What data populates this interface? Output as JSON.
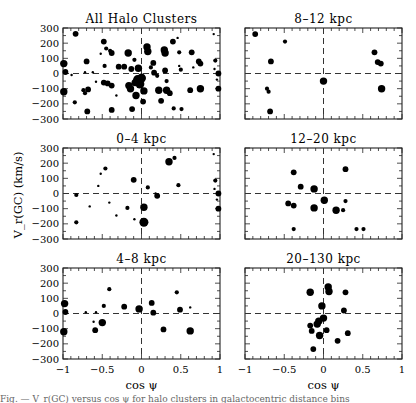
{
  "figure": {
    "ylabel": "V_r(GC) (km/s)",
    "xlabel": "cos ψ",
    "caption": "Fig. — V_r(GC) versus cos ψ for halo clusters in galactocentric distance bins"
  },
  "chart_data": [
    {
      "type": "scatter",
      "title": "All Halo Clusters",
      "xlabel": "",
      "ylabel": "V_r(GC) (km/s)",
      "xlim": [
        -1,
        1
      ],
      "ylim": [
        -300,
        300
      ],
      "xticks": [
        -1,
        -0.5,
        0,
        0.5,
        1
      ],
      "yticks": [
        -300,
        -200,
        -100,
        0,
        100,
        200,
        300
      ],
      "grid": false,
      "reference_lines": {
        "x": 0,
        "y": 0,
        "style": "dashed"
      },
      "points": [
        {
          "x": -0.84,
          "y": 262,
          "s": 3
        },
        {
          "x": -0.99,
          "y": 65,
          "s": 4
        },
        {
          "x": -0.97,
          "y": 10,
          "s": 3
        },
        {
          "x": -0.99,
          "y": -120,
          "s": 4
        },
        {
          "x": -0.89,
          "y": -10,
          "s": 1
        },
        {
          "x": -0.85,
          "y": -190,
          "s": 2
        },
        {
          "x": -0.7,
          "y": 80,
          "s": 3
        },
        {
          "x": -0.72,
          "y": 8,
          "s": 1
        },
        {
          "x": -0.74,
          "y": -110,
          "s": 2
        },
        {
          "x": -0.72,
          "y": -130,
          "s": 2
        },
        {
          "x": -0.68,
          "y": -105,
          "s": 3
        },
        {
          "x": -0.69,
          "y": -250,
          "s": 3
        },
        {
          "x": -0.62,
          "y": 8,
          "s": 1
        },
        {
          "x": -0.58,
          "y": -55,
          "s": 1
        },
        {
          "x": -0.48,
          "y": 210,
          "s": 3
        },
        {
          "x": -0.52,
          "y": 130,
          "s": 1
        },
        {
          "x": -0.45,
          "y": 165,
          "s": 2
        },
        {
          "x": -0.4,
          "y": 150,
          "s": 2
        },
        {
          "x": -0.38,
          "y": 135,
          "s": 3
        },
        {
          "x": -0.47,
          "y": 50,
          "s": 2
        },
        {
          "x": -0.48,
          "y": -60,
          "s": 3
        },
        {
          "x": -0.43,
          "y": -65,
          "s": 3
        },
        {
          "x": -0.38,
          "y": -80,
          "s": 3
        },
        {
          "x": -0.38,
          "y": -240,
          "s": 3
        },
        {
          "x": -0.32,
          "y": -145,
          "s": 1
        },
        {
          "x": -0.29,
          "y": 45,
          "s": 3
        },
        {
          "x": -0.22,
          "y": 45,
          "s": 3
        },
        {
          "x": -0.17,
          "y": 135,
          "s": 4
        },
        {
          "x": -0.16,
          "y": -80,
          "s": 4
        },
        {
          "x": -0.14,
          "y": -100,
          "s": 4
        },
        {
          "x": -0.13,
          "y": 30,
          "s": 3
        },
        {
          "x": -0.12,
          "y": -235,
          "s": 3
        },
        {
          "x": -0.09,
          "y": 90,
          "s": 2
        },
        {
          "x": -0.08,
          "y": -60,
          "s": 4
        },
        {
          "x": -0.07,
          "y": -145,
          "s": 4
        },
        {
          "x": -0.05,
          "y": -40,
          "s": 5
        },
        {
          "x": -0.04,
          "y": 35,
          "s": 4
        },
        {
          "x": -0.02,
          "y": -70,
          "s": 5
        },
        {
          "x": 0.0,
          "y": -30,
          "s": 5
        },
        {
          "x": 0.03,
          "y": -115,
          "s": 4
        },
        {
          "x": 0.02,
          "y": -185,
          "s": 3
        },
        {
          "x": 0.07,
          "y": 175,
          "s": 4
        },
        {
          "x": 0.08,
          "y": 145,
          "s": 4
        },
        {
          "x": 0.12,
          "y": 40,
          "s": 2
        },
        {
          "x": 0.15,
          "y": 70,
          "s": 3
        },
        {
          "x": 0.16,
          "y": 5,
          "s": 3
        },
        {
          "x": 0.22,
          "y": -110,
          "s": 4
        },
        {
          "x": 0.2,
          "y": -15,
          "s": 2
        },
        {
          "x": 0.25,
          "y": -180,
          "s": 3
        },
        {
          "x": 0.29,
          "y": 155,
          "s": 4
        },
        {
          "x": 0.3,
          "y": 135,
          "s": 4
        },
        {
          "x": 0.3,
          "y": 20,
          "s": 3
        },
        {
          "x": 0.32,
          "y": -50,
          "s": 2
        },
        {
          "x": 0.32,
          "y": -110,
          "s": 4
        },
        {
          "x": 0.36,
          "y": -130,
          "s": 3
        },
        {
          "x": 0.4,
          "y": 210,
          "s": 3
        },
        {
          "x": 0.46,
          "y": 235,
          "s": 1
        },
        {
          "x": 0.48,
          "y": 140,
          "s": 2
        },
        {
          "x": 0.48,
          "y": 50,
          "s": 1
        },
        {
          "x": 0.5,
          "y": 25,
          "s": 2
        },
        {
          "x": 0.41,
          "y": -230,
          "s": 2
        },
        {
          "x": 0.51,
          "y": -235,
          "s": 2
        },
        {
          "x": 0.64,
          "y": 140,
          "s": 3
        },
        {
          "x": 0.62,
          "y": -110,
          "s": 3
        },
        {
          "x": 0.73,
          "y": 80,
          "s": 3
        },
        {
          "x": 0.75,
          "y": 65,
          "s": 3
        },
        {
          "x": 0.75,
          "y": -100,
          "s": 4
        },
        {
          "x": 0.66,
          "y": 40,
          "s": 1
        },
        {
          "x": 0.92,
          "y": 260,
          "s": 1
        },
        {
          "x": 0.94,
          "y": 85,
          "s": 2
        },
        {
          "x": 0.93,
          "y": 30,
          "s": 1
        },
        {
          "x": 0.98,
          "y": 0,
          "s": 3
        },
        {
          "x": 0.96,
          "y": -40,
          "s": 1
        },
        {
          "x": 0.98,
          "y": -100,
          "s": 3
        }
      ]
    },
    {
      "type": "scatter",
      "title": "8–12 kpc",
      "xlim": [
        -1,
        1
      ],
      "ylim": [
        -300,
        300
      ],
      "points": [
        {
          "x": -0.87,
          "y": 260,
          "s": 3
        },
        {
          "x": -0.49,
          "y": 210,
          "s": 2
        },
        {
          "x": -0.67,
          "y": 80,
          "s": 3
        },
        {
          "x": -0.72,
          "y": -100,
          "s": 2
        },
        {
          "x": -0.7,
          "y": -120,
          "s": 2
        },
        {
          "x": -0.68,
          "y": -250,
          "s": 3
        },
        {
          "x": 0.0,
          "y": -50,
          "s": 4
        },
        {
          "x": 0.65,
          "y": 140,
          "s": 3
        },
        {
          "x": 0.69,
          "y": 75,
          "s": 3
        },
        {
          "x": 0.73,
          "y": 65,
          "s": 3
        },
        {
          "x": 0.74,
          "y": -100,
          "s": 4
        }
      ]
    },
    {
      "type": "scatter",
      "title": "0–4 kpc",
      "xlim": [
        -1,
        1
      ],
      "ylim": [
        -300,
        300
      ],
      "points": [
        {
          "x": -0.83,
          "y": -10,
          "s": 2
        },
        {
          "x": -0.83,
          "y": -190,
          "s": 2
        },
        {
          "x": -0.66,
          "y": -85,
          "s": 1
        },
        {
          "x": -0.55,
          "y": 50,
          "s": 1
        },
        {
          "x": -0.52,
          "y": 130,
          "s": 1
        },
        {
          "x": -0.46,
          "y": 165,
          "s": 2
        },
        {
          "x": -0.41,
          "y": -60,
          "s": 1
        },
        {
          "x": -0.32,
          "y": -145,
          "s": 1
        },
        {
          "x": -0.18,
          "y": -95,
          "s": 2
        },
        {
          "x": -0.1,
          "y": 90,
          "s": 3
        },
        {
          "x": -0.09,
          "y": -170,
          "s": 1
        },
        {
          "x": 0.03,
          "y": -90,
          "s": 4
        },
        {
          "x": 0.03,
          "y": -190,
          "s": 5
        },
        {
          "x": 0.08,
          "y": 40,
          "s": 2
        },
        {
          "x": 0.18,
          "y": 0,
          "s": 1
        },
        {
          "x": 0.2,
          "y": -15,
          "s": 3
        },
        {
          "x": 0.35,
          "y": 210,
          "s": 4
        },
        {
          "x": 0.42,
          "y": 235,
          "s": 2
        },
        {
          "x": 0.47,
          "y": 55,
          "s": 2
        },
        {
          "x": 0.92,
          "y": 260,
          "s": 1
        },
        {
          "x": 0.94,
          "y": 85,
          "s": 2
        },
        {
          "x": 0.93,
          "y": 30,
          "s": 1
        },
        {
          "x": 0.98,
          "y": 0,
          "s": 3
        },
        {
          "x": 0.96,
          "y": -40,
          "s": 1
        },
        {
          "x": 0.98,
          "y": -100,
          "s": 3
        }
      ]
    },
    {
      "type": "scatter",
      "title": "12–20 kpc",
      "xlim": [
        -1,
        1
      ],
      "ylim": [
        -300,
        300
      ],
      "points": [
        {
          "x": -0.38,
          "y": 140,
          "s": 3
        },
        {
          "x": -0.29,
          "y": 45,
          "s": 3
        },
        {
          "x": -0.12,
          "y": 30,
          "s": 4
        },
        {
          "x": -0.45,
          "y": -65,
          "s": 3
        },
        {
          "x": -0.38,
          "y": -80,
          "s": 3
        },
        {
          "x": -0.12,
          "y": -95,
          "s": 4
        },
        {
          "x": 0.01,
          "y": -45,
          "s": 4
        },
        {
          "x": 0.16,
          "y": -110,
          "s": 4
        },
        {
          "x": 0.25,
          "y": -110,
          "s": 2
        },
        {
          "x": 0.28,
          "y": -50,
          "s": 2
        },
        {
          "x": 0.28,
          "y": 160,
          "s": 3
        },
        {
          "x": -0.38,
          "y": -235,
          "s": 2
        },
        {
          "x": 0.42,
          "y": -235,
          "s": 2
        },
        {
          "x": 0.51,
          "y": -235,
          "s": 2
        }
      ]
    },
    {
      "type": "scatter",
      "title": "4–8 kpc",
      "xlim": [
        -1,
        1
      ],
      "ylim": [
        -300,
        300
      ],
      "points": [
        {
          "x": -0.98,
          "y": 65,
          "s": 4
        },
        {
          "x": -0.97,
          "y": 10,
          "s": 3
        },
        {
          "x": -0.99,
          "y": -120,
          "s": 4
        },
        {
          "x": -0.71,
          "y": 8,
          "s": 1
        },
        {
          "x": -0.58,
          "y": 8,
          "s": 1
        },
        {
          "x": -0.61,
          "y": -55,
          "s": 1
        },
        {
          "x": -0.59,
          "y": -110,
          "s": 3
        },
        {
          "x": -0.48,
          "y": 50,
          "s": 2
        },
        {
          "x": -0.5,
          "y": -60,
          "s": 4
        },
        {
          "x": -0.41,
          "y": 160,
          "s": 2
        },
        {
          "x": -0.22,
          "y": 45,
          "s": 3
        },
        {
          "x": -0.03,
          "y": 30,
          "s": 4
        },
        {
          "x": 0.13,
          "y": 70,
          "s": 3
        },
        {
          "x": 0.15,
          "y": 5,
          "s": 3
        },
        {
          "x": 0.28,
          "y": -105,
          "s": 3
        },
        {
          "x": 0.45,
          "y": 140,
          "s": 2
        },
        {
          "x": 0.49,
          "y": 25,
          "s": 3
        },
        {
          "x": 0.62,
          "y": 40,
          "s": 1
        },
        {
          "x": 0.62,
          "y": -115,
          "s": 4
        }
      ]
    },
    {
      "type": "scatter",
      "title": "20–130 kpc",
      "xlabel": "cos ψ",
      "xlim": [
        -1,
        1
      ],
      "ylim": [
        -300,
        300
      ],
      "points": [
        {
          "x": -0.17,
          "y": 140,
          "s": 4
        },
        {
          "x": 0.06,
          "y": 175,
          "s": 4
        },
        {
          "x": 0.07,
          "y": 145,
          "s": 4
        },
        {
          "x": 0.28,
          "y": 140,
          "s": 3
        },
        {
          "x": -0.02,
          "y": 50,
          "s": 4
        },
        {
          "x": 0.26,
          "y": 20,
          "s": 3
        },
        {
          "x": 0.0,
          "y": -30,
          "s": 4
        },
        {
          "x": -0.06,
          "y": -50,
          "s": 4
        },
        {
          "x": -0.08,
          "y": -70,
          "s": 4
        },
        {
          "x": -0.17,
          "y": -80,
          "s": 3
        },
        {
          "x": -0.15,
          "y": -115,
          "s": 3
        },
        {
          "x": 0.04,
          "y": -110,
          "s": 3
        },
        {
          "x": -0.05,
          "y": -145,
          "s": 4
        },
        {
          "x": 0.31,
          "y": -130,
          "s": 3
        },
        {
          "x": 0.18,
          "y": -180,
          "s": 3
        },
        {
          "x": -0.13,
          "y": -235,
          "s": 3
        }
      ]
    }
  ],
  "panels_layout": [
    {
      "idx": 0,
      "left": 63,
      "top": 28,
      "show_yticks": true,
      "show_xticks": false
    },
    {
      "idx": 1,
      "left": 245,
      "top": 28,
      "show_yticks": false,
      "show_xticks": false
    },
    {
      "idx": 2,
      "left": 63,
      "top": 148,
      "show_yticks": true,
      "show_xticks": false
    },
    {
      "idx": 3,
      "left": 245,
      "top": 148,
      "show_yticks": false,
      "show_xticks": false
    },
    {
      "idx": 4,
      "left": 63,
      "top": 268,
      "show_yticks": true,
      "show_xticks": true
    },
    {
      "idx": 5,
      "left": 245,
      "top": 268,
      "show_yticks": false,
      "show_xticks": true
    }
  ],
  "tick_labels": {
    "y": [
      "300",
      "200",
      "100",
      "0",
      "−100",
      "−200",
      "−300"
    ],
    "x": [
      "−1",
      "−0.5",
      "0",
      "0.5",
      "1"
    ]
  }
}
